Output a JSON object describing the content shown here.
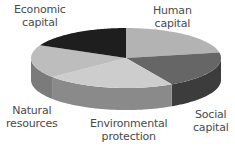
{
  "chart_data": {
    "type": "pie",
    "style": "3d",
    "title": "",
    "categories": [
      "Human capital",
      "Social capital",
      "Environmental protection",
      "Natural resources",
      "Economic capital"
    ],
    "values": [
      22,
      20,
      22,
      18,
      18
    ],
    "unit": "approx. share (%) read from slice angles",
    "slices": [
      {
        "name": "Human capital",
        "value": 22,
        "top_color": "#b3b3b3",
        "side_color": "#8e8e8e"
      },
      {
        "name": "Social capital",
        "value": 20,
        "top_color": "#666666",
        "side_color": "#3c3c3c"
      },
      {
        "name": "Environmental protection",
        "value": 22,
        "top_color": "#cdcdcd",
        "side_color": "#8a8a8a"
      },
      {
        "name": "Natural resources",
        "value": 18,
        "top_color": "#bdbdbd",
        "side_color": "#7b7b7b"
      },
      {
        "name": "Economic capital",
        "value": 18,
        "top_color": "#1e1e1e",
        "side_color": "#111111"
      }
    ],
    "legend": "none (labels placed around the pie)"
  },
  "labels": {
    "economic": [
      "Economic",
      "capital"
    ],
    "human": [
      "Human",
      "capital"
    ],
    "natural": [
      "Natural",
      "resources"
    ],
    "environmental": [
      "Environmental",
      "protection"
    ],
    "social": [
      "Social",
      "capital"
    ]
  }
}
